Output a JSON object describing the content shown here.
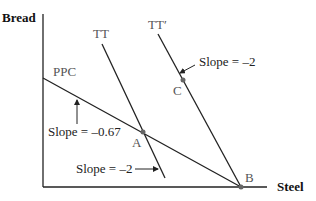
{
  "axes": {
    "y_label": "Bread",
    "x_label": "Steel"
  },
  "curves": {
    "ppc": {
      "label": "PPC",
      "slope_label": "Slope = –0.67"
    },
    "tt": {
      "label": "TT",
      "slope_label": "Slope = –2"
    },
    "tt_prime": {
      "label": "TT′",
      "slope_label": "Slope = –2"
    }
  },
  "points": {
    "a": "A",
    "b": "B",
    "c": "C"
  },
  "colors": {
    "line": "#222222",
    "point": "#666666"
  }
}
